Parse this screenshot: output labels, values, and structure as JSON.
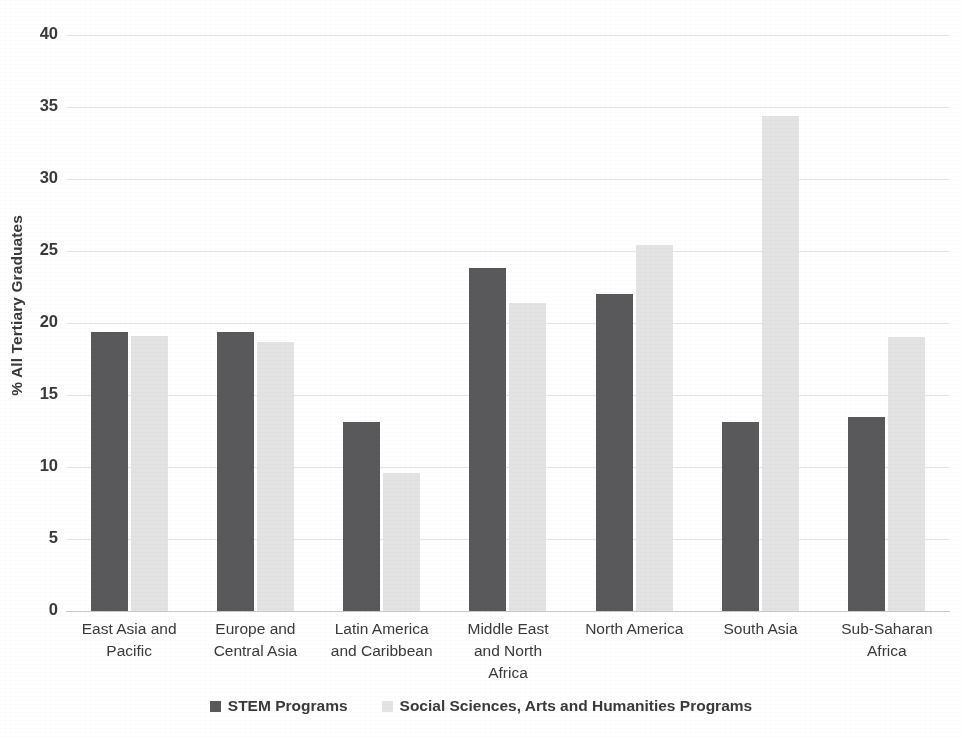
{
  "chart_data": {
    "type": "bar",
    "title": "",
    "xlabel": "",
    "ylabel": "% All Tertiary Graduates",
    "ylim": [
      0,
      40
    ],
    "ytick_step": 5,
    "yticks": [
      0,
      5,
      10,
      15,
      20,
      25,
      30,
      35,
      40
    ],
    "ytick_labels": [
      "0",
      "5",
      "10",
      "15",
      "20",
      "25",
      "30",
      "35",
      "40"
    ],
    "grid": true,
    "grid_axis": "y",
    "legend_position": "bottom",
    "categories": [
      "East Asia and Pacific",
      "Europe and Central Asia",
      "Latin America and Caribbean",
      "Middle East and North Africa",
      "North America",
      "South Asia",
      "Sub-Saharan Africa"
    ],
    "category_label_lines": [
      [
        "East Asia and",
        "Pacific"
      ],
      [
        "Europe and",
        "Central Asia"
      ],
      [
        "Latin America",
        "and Caribbean"
      ],
      [
        "Middle East",
        "and North",
        "Africa"
      ],
      [
        "North America"
      ],
      [
        "South Asia"
      ],
      [
        "Sub-Saharan",
        "Africa"
      ]
    ],
    "series": [
      {
        "name": "STEM Programs",
        "color": "#59595b",
        "values": [
          19.4,
          19.4,
          13.1,
          23.8,
          22.0,
          13.1,
          13.5
        ]
      },
      {
        "name": "Social Sciences, Arts and Humanities Programs",
        "color": "#e3e3e3",
        "values": [
          19.1,
          18.7,
          9.6,
          21.4,
          25.4,
          34.4,
          19.0
        ]
      }
    ]
  },
  "legend": {
    "items": [
      {
        "label": "STEM Programs",
        "swatch": "stem"
      },
      {
        "label": "Social Sciences, Arts and Humanities Programs",
        "swatch": "ssah"
      }
    ]
  }
}
